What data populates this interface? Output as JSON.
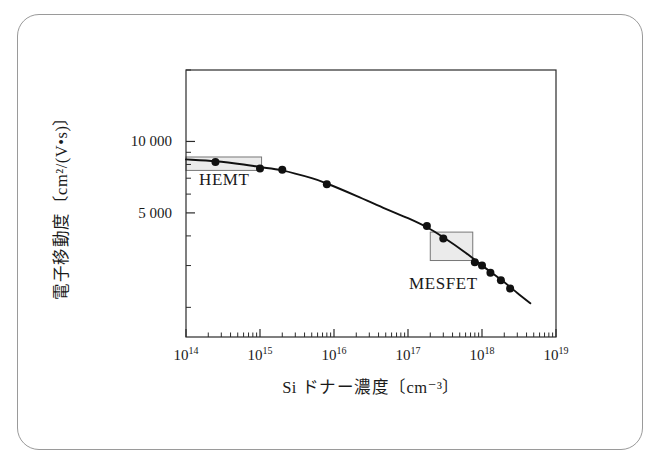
{
  "figure": {
    "frame": {
      "border_color": "#9a9a9a",
      "background": "#ffffff"
    },
    "plot": {
      "frame_color": "#2b2b2b",
      "curve_color": "#111111",
      "marker_color": "#111111",
      "region_box_fill": "#e4e4e4",
      "region_box_stroke": "#777777"
    }
  },
  "chart_data": {
    "type": "line",
    "title": "",
    "xlabel": "Si ドナー濃度〔cm⁻³〕",
    "ylabel": "電子移動度〔cm²/(V•s)〕",
    "xscale": "log",
    "yscale": "log",
    "xlim": [
      100000000000000.0,
      1e+19
    ],
    "ylim": [
      1500,
      20000
    ],
    "grid": false,
    "legend": null,
    "x_tick_labels": [
      "10¹⁴",
      "10¹⁵",
      "10¹⁶",
      "10¹⁷",
      "10¹⁸",
      "10¹⁹"
    ],
    "x_tick_bases": [
      14,
      15,
      16,
      17,
      18,
      19
    ],
    "y_tick_labels": [
      "10 000",
      "5 000"
    ],
    "y_tick_values": [
      10000,
      5000
    ],
    "series": [
      {
        "name": "electron mobility vs Si donor concentration",
        "x": [
          250000000000000.0,
          1000000000000000.0,
          2000000000000000.0,
          8000000000000000.0,
          1.8e+17,
          3e+17,
          8e+17,
          1e+18,
          1.3e+18,
          1.8e+18,
          2.4e+18
        ],
        "y": [
          8200,
          7700,
          7600,
          6600,
          4400,
          3900,
          3100,
          3000,
          2800,
          2600,
          2400
        ]
      }
    ],
    "curve_points": [
      [
        100000000000000.0,
        8400
      ],
      [
        250000000000000.0,
        8250
      ],
      [
        600000000000000.0,
        8000
      ],
      [
        1000000000000000.0,
        7800
      ],
      [
        2000000000000000.0,
        7550
      ],
      [
        5000000000000000.0,
        7000
      ],
      [
        8000000000000000.0,
        6650
      ],
      [
        2e+16,
        5900
      ],
      [
        5e+16,
        5200
      ],
      [
        1e+17,
        4750
      ],
      [
        1.8e+17,
        4350
      ],
      [
        3e+17,
        3950
      ],
      [
        6e+17,
        3400
      ],
      [
        1e+18,
        3000
      ],
      [
        1.8e+18,
        2620
      ],
      [
        3e+18,
        2300
      ],
      [
        4.5e+18,
        2080
      ]
    ],
    "annotations": [
      {
        "label": "HEMT",
        "box": {
          "x_range": [
            100000000000000.0,
            1050000000000000.0
          ],
          "y_range": [
            7550,
            8600
          ]
        }
      },
      {
        "label": "MESFET",
        "box": {
          "x_range": [
            2e+17,
            7.5e+17
          ],
          "y_range": [
            3150,
            4150
          ]
        }
      }
    ]
  }
}
